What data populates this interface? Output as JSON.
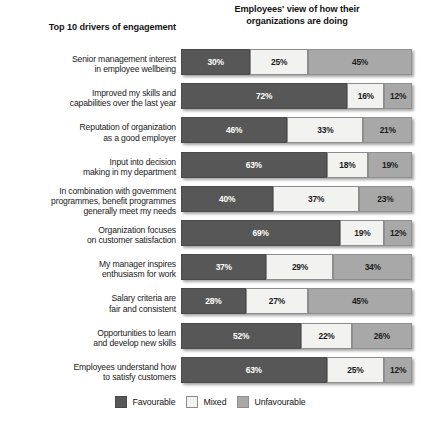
{
  "headers": {
    "left": "Top 10 drivers of engagement",
    "right_line1": "Employees' view of how their",
    "right_line2": "organizations are doing"
  },
  "legend": {
    "favourable": "Favourable",
    "mixed": "Mixed",
    "unfavourable": "Unfavourable"
  },
  "caption": "",
  "colors": {
    "favourable": "#575757",
    "mixed": "#f2f2f0",
    "unfavourable": "#a8a8a8"
  },
  "rows": [
    {
      "label_l1": "Senior management interest",
      "label_l2": "in employee wellbeing",
      "favourable": "30%",
      "mixed": "25%",
      "unfavourable": "45%"
    },
    {
      "label_l1": "Improved my skills and",
      "label_l2": "capabilities over the last year",
      "favourable": "72%",
      "mixed": "16%",
      "unfavourable": "12%"
    },
    {
      "label_l1": "Reputation of organization",
      "label_l2": "as a good employer",
      "favourable": "46%",
      "mixed": "33%",
      "unfavourable": "21%"
    },
    {
      "label_l1": "Input into decision",
      "label_l2": "making in my department",
      "favourable": "63%",
      "mixed": "18%",
      "unfavourable": "19%"
    },
    {
      "label_l1": "In combination with government",
      "label_l2": "programmes, benefit programmes",
      "label_l3": "generally meet my needs",
      "favourable": "40%",
      "mixed": "37%",
      "unfavourable": "23%"
    },
    {
      "label_l1": "Organization focuses",
      "label_l2": "on customer satisfaction",
      "favourable": "69%",
      "mixed": "19%",
      "unfavourable": "12%"
    },
    {
      "label_l1": "My manager inspires",
      "label_l2": "enthusiasm for work",
      "favourable": "37%",
      "mixed": "29%",
      "unfavourable": "34%"
    },
    {
      "label_l1": "Salary criteria are",
      "label_l2": "fair and consistent",
      "favourable": "28%",
      "mixed": "27%",
      "unfavourable": "45%"
    },
    {
      "label_l1": "Opportunities to learn",
      "label_l2": "and develop new skills",
      "favourable": "52%",
      "mixed": "22%",
      "unfavourable": "26%"
    },
    {
      "label_l1": "Employees understand how",
      "label_l2": "to satisfy customers",
      "favourable": "63%",
      "mixed": "25%",
      "unfavourable": "12%"
    }
  ],
  "chart_data": {
    "type": "bar",
    "title": "Employees' view of how their organizations are doing",
    "subtitle": "Top 10 drivers of engagement",
    "orientation": "horizontal",
    "stacked": true,
    "stacked_total": 100,
    "xlabel": "",
    "ylabel": "",
    "xlim": [
      0,
      100
    ],
    "grid": false,
    "legend_position": "bottom-center",
    "legend_entries": [
      "Favourable",
      "Mixed",
      "Unfavourable"
    ],
    "categories": [
      "Senior management interest in employee wellbeing",
      "Improved my skills and capabilities over the last year",
      "Reputation of organization as a good employer",
      "Input into decision making in my department",
      "In combination with government programmes, benefit programmes generally meet my needs",
      "Organization focuses on customer satisfaction",
      "My manager inspires enthusiasm for work",
      "Salary criteria are fair and consistent",
      "Opportunities to learn and develop new skills",
      "Employees understand how to satisfy customers"
    ],
    "series": [
      {
        "name": "Favourable",
        "color": "#575757",
        "values": [
          30,
          72,
          46,
          63,
          40,
          69,
          37,
          28,
          52,
          63
        ]
      },
      {
        "name": "Mixed",
        "color": "#f2f2f0",
        "values": [
          25,
          16,
          33,
          18,
          37,
          19,
          29,
          27,
          22,
          25
        ]
      },
      {
        "name": "Unfavourable",
        "color": "#a8a8a8",
        "values": [
          45,
          12,
          21,
          19,
          23,
          12,
          34,
          45,
          26,
          12
        ]
      }
    ]
  }
}
